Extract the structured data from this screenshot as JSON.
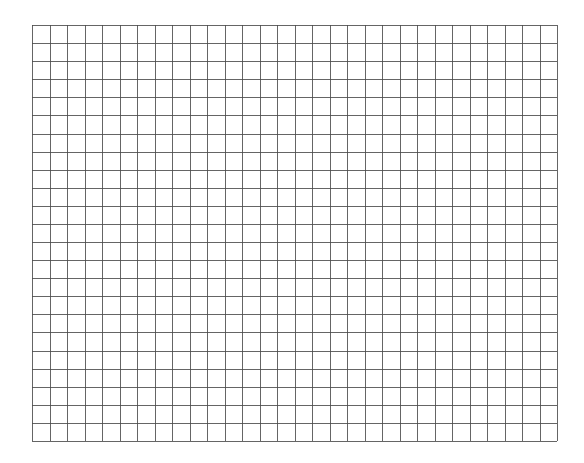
{
  "grid": {
    "columns": 30,
    "rows": 23,
    "line_color": "#4a4a4a",
    "background": "#ffffff"
  }
}
